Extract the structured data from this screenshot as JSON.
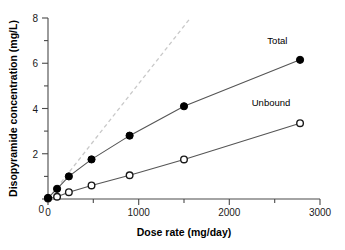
{
  "chart_data": {
    "type": "line",
    "title": "",
    "xlabel": "Dose rate (mg/day)",
    "ylabel": "Disopyramide concentration (mg/L)",
    "xlim": [
      0,
      3000
    ],
    "ylim": [
      0,
      8
    ],
    "grid": false,
    "legend_position": "inline-right",
    "x_ticks_major": [
      0,
      1000,
      2000,
      3000
    ],
    "x_tick_labels": [
      "0",
      "1000",
      "2000",
      "3000"
    ],
    "x_ticks_minor": [
      500,
      1500,
      2500
    ],
    "y_ticks_major": [
      0,
      2,
      4,
      6,
      8
    ],
    "y_tick_labels": [
      "0",
      "2",
      "4",
      "6",
      "8"
    ],
    "y_ticks_minor": [
      1,
      3,
      5,
      7
    ],
    "series": [
      {
        "name": "Total",
        "marker": "filled-circle",
        "color": "#000000",
        "label_x": 2530,
        "label_y": 6.85,
        "x": [
          0,
          100,
          230,
          480,
          900,
          1500,
          2780
        ],
        "y": [
          0.05,
          0.45,
          1.0,
          1.75,
          2.8,
          4.1,
          6.15
        ]
      },
      {
        "name": "Unbound",
        "marker": "open-circle",
        "color": "#1a1a1a",
        "label_x": 2460,
        "label_y": 4.1,
        "x": [
          0,
          100,
          230,
          480,
          900,
          1500,
          2780
        ],
        "y": [
          0.02,
          0.1,
          0.3,
          0.6,
          1.05,
          1.75,
          3.35
        ]
      }
    ],
    "reference_line": {
      "name": "linear-extrapolation",
      "style": "dashed",
      "color": "#c8c8c8",
      "x": [
        0,
        1570
      ],
      "y": [
        0,
        8.0
      ]
    }
  }
}
